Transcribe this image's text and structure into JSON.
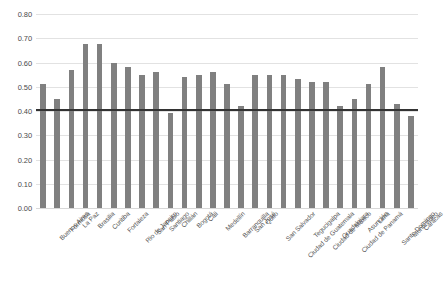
{
  "chart_data": {
    "type": "bar",
    "title": "",
    "subtitle": "",
    "xlabel": "",
    "ylabel": "",
    "ylim": [
      0.0,
      0.8
    ],
    "ytick_values": [
      0.0,
      0.1,
      0.2,
      0.3,
      0.4,
      0.5,
      0.6,
      0.7,
      0.8
    ],
    "ytick_labels": [
      "0.00",
      "0.10",
      "0.20",
      "0.30",
      "0.40",
      "0.50",
      "0.60",
      "0.70",
      "0.80"
    ],
    "grid": true,
    "legend": "none",
    "bar_color": "#808080",
    "gridline_color": "#e2e2e2",
    "background_color": "#ffffff",
    "reference_line": {
      "value": 0.41,
      "color": "#333333",
      "label": ""
    },
    "categories": [
      "Buenos Aires",
      "Formosa",
      "La Paz",
      "Brasilia",
      "Curitiba",
      "Fortaleza",
      "Rio de Janeiro",
      "San Pablo",
      "Santiago",
      "Chillán",
      "Bogotá",
      "Cali",
      "Medellín",
      "Barranquilla",
      "San José",
      "Quito",
      "San Salvador",
      "Ciudad de Guatemala",
      "Tegucigalpa",
      "Ciudad de México",
      "Guadalajara",
      "Ciudad de Panamá",
      "Asunción",
      "Lima",
      "Santo Domingo",
      "Montevideo",
      "Caracas"
    ],
    "values": [
      0.51,
      0.45,
      0.57,
      0.675,
      0.675,
      0.6,
      0.58,
      0.55,
      0.56,
      0.39,
      0.54,
      0.55,
      0.56,
      0.51,
      0.42,
      0.55,
      0.55,
      0.55,
      0.53,
      0.52,
      0.52,
      0.42,
      0.45,
      0.51,
      0.58,
      0.43,
      0.38
    ]
  }
}
